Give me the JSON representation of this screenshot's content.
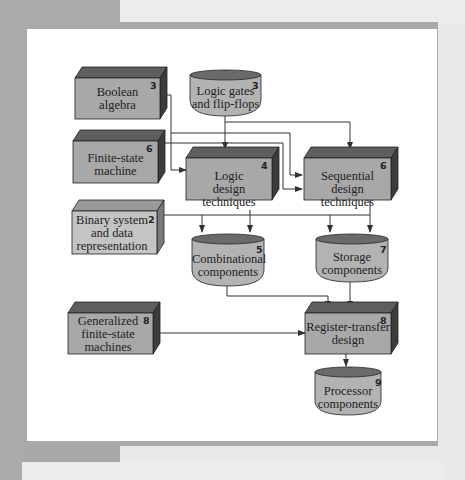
{
  "diagram": {
    "nodes": [
      {
        "id": "boolean-algebra",
        "label_lines": [
          "Boolean",
          "algebra"
        ],
        "chapter": "3",
        "shape": "box"
      },
      {
        "id": "logic-gates",
        "label_lines": [
          "Logic gates",
          "and flip-flops"
        ],
        "chapter": "3",
        "shape": "cylinder"
      },
      {
        "id": "finite-state-machine",
        "label_lines": [
          "Finite-state",
          "machine"
        ],
        "chapter": "6",
        "shape": "box"
      },
      {
        "id": "logic-design",
        "label_lines": [
          "Logic",
          "design techniques"
        ],
        "chapter": "4",
        "shape": "box"
      },
      {
        "id": "sequential-design",
        "label_lines": [
          "Sequential",
          "design techniques"
        ],
        "chapter": "6",
        "shape": "box"
      },
      {
        "id": "binary-system",
        "label_lines": [
          "Binary system",
          "and data",
          "representation"
        ],
        "chapter": "2",
        "shape": "box-light"
      },
      {
        "id": "combinational",
        "label_lines": [
          "Combinational",
          "components"
        ],
        "chapter": "5",
        "shape": "cylinder"
      },
      {
        "id": "storage",
        "label_lines": [
          "Storage",
          "components"
        ],
        "chapter": "7",
        "shape": "cylinder"
      },
      {
        "id": "generalized-fsm",
        "label_lines": [
          "Generalized",
          "finite-state",
          "machines"
        ],
        "chapter": "8",
        "shape": "box"
      },
      {
        "id": "register-transfer",
        "label_lines": [
          "Register-transfer",
          "design"
        ],
        "chapter": "8",
        "shape": "box"
      },
      {
        "id": "processor",
        "label_lines": [
          "Processor",
          "components"
        ],
        "chapter": "9",
        "shape": "cylinder"
      }
    ],
    "edges": [
      {
        "from": "boolean-algebra",
        "to": "logic-design"
      },
      {
        "from": "boolean-algebra",
        "to": "sequential-design"
      },
      {
        "from": "logic-gates",
        "to": "logic-design"
      },
      {
        "from": "logic-gates",
        "to": "sequential-design"
      },
      {
        "from": "finite-state-machine",
        "to": "sequential-design"
      },
      {
        "from": "logic-design",
        "to": "combinational"
      },
      {
        "from": "logic-design",
        "to": "storage"
      },
      {
        "from": "sequential-design",
        "to": "storage"
      },
      {
        "from": "binary-system",
        "to": "combinational"
      },
      {
        "from": "binary-system",
        "to": "storage"
      },
      {
        "from": "combinational",
        "to": "register-transfer"
      },
      {
        "from": "storage",
        "to": "register-transfer"
      },
      {
        "from": "generalized-fsm",
        "to": "register-transfer"
      },
      {
        "from": "register-transfer",
        "to": "processor"
      }
    ],
    "colors": {
      "box_face": "#a8a8a8",
      "box_top": "#5e5e5e",
      "box_side": "#3c3c3c",
      "box_light_face": "#c4c4c4",
      "box_light_top": "#9a9a9a",
      "box_light_side": "#7a7a7a",
      "cylinder_body": "#b3b3b3",
      "cylinder_top": "#6a6a6a",
      "line": "#333333",
      "panel": "#ffffff",
      "frame": "#a9a9a9"
    }
  },
  "labels": {
    "boolean": {
      "l1": "Boolean",
      "l2": "algebra",
      "n": "3"
    },
    "gates": {
      "l1": "Logic gates",
      "l2": "and flip-flops",
      "n": "3"
    },
    "fsm": {
      "l1": "Finite-state",
      "l2": "machine",
      "n": "6"
    },
    "logic": {
      "l1": "Logic",
      "l2": "design techniques",
      "n": "4"
    },
    "seq": {
      "l1": "Sequential",
      "l2": "design techniques",
      "n": "6"
    },
    "binary": {
      "l1": "Binary system",
      "l2": "and data",
      "l3": "representation",
      "n": "2"
    },
    "comb": {
      "l1": "Combinational",
      "l2": "components",
      "n": "5"
    },
    "storage": {
      "l1": "Storage",
      "l2": "components",
      "n": "7"
    },
    "gfsm": {
      "l1": "Generalized",
      "l2": "finite-state",
      "l3": "machines",
      "n": "8"
    },
    "rtl": {
      "l1": "Register-transfer",
      "l2": "design",
      "n": "8"
    },
    "proc": {
      "l1": "Processor",
      "l2": "components",
      "n": "9"
    }
  }
}
